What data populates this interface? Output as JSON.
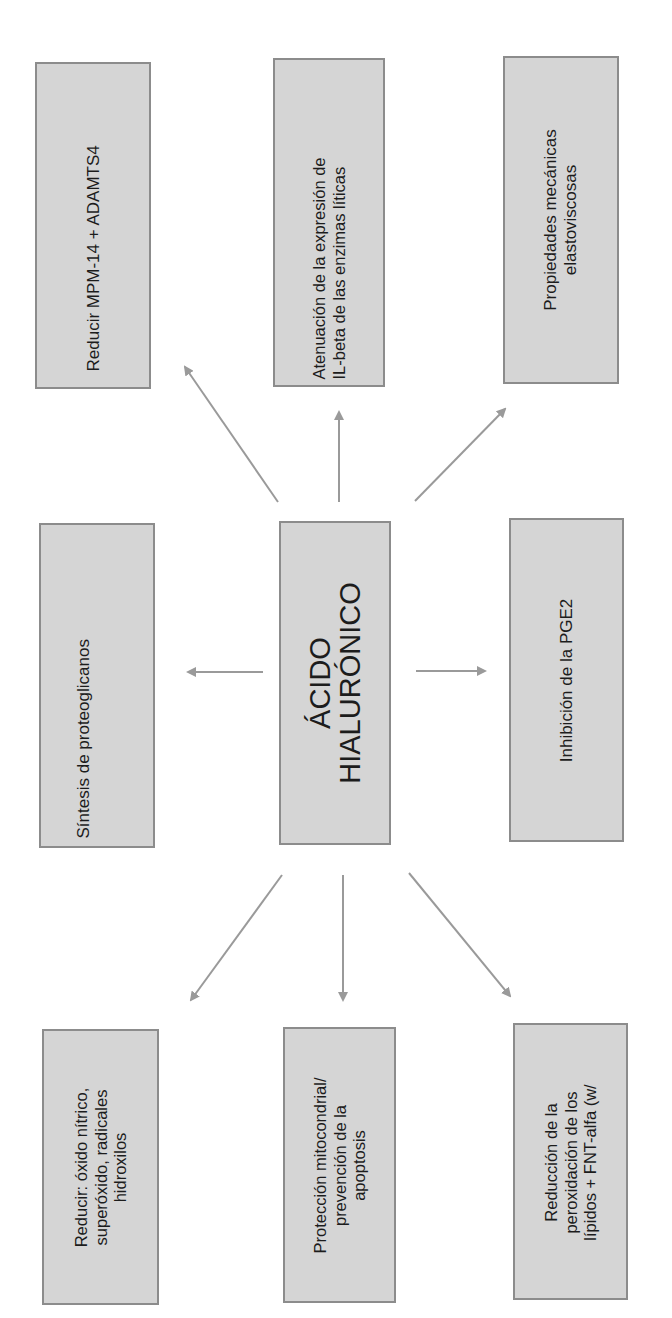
{
  "diagram": {
    "center": {
      "lines": [
        "ÁCIDO",
        "HIALURÓNICO"
      ]
    },
    "effects": {
      "top_left": {
        "lines": [
          "Reducir MPM-14 + ADAMTS4"
        ]
      },
      "top_middle": {
        "lines": [
          "Atenuación de la expresión de",
          "IL-beta de las enzimas líticas"
        ]
      },
      "top_right": {
        "lines": [
          "Propiedades mecánicas",
          "elastoviscosas"
        ]
      },
      "middle_left": {
        "lines": [
          "Síntesis de proteoglicanos"
        ]
      },
      "middle_right": {
        "lines": [
          "Inhibición de la PGE2"
        ]
      },
      "bottom_left": {
        "lines": [
          "Reducir: óxido nítrico,",
          "superóxido, radicales",
          "hidroxilos"
        ]
      },
      "bottom_middle": {
        "lines": [
          "Protección mitocondrial/",
          "prevención de la",
          "apoptosis"
        ]
      },
      "bottom_right": {
        "lines": [
          "Reducción de la",
          "peroxidación de los",
          "lípidos + FNT-alfa (w/"
        ]
      }
    },
    "colors": {
      "box_fill": "#d5d5d5",
      "box_border": "#8c8c8c",
      "arrow": "#9a9a9a",
      "text": "#1c1c1c"
    }
  }
}
